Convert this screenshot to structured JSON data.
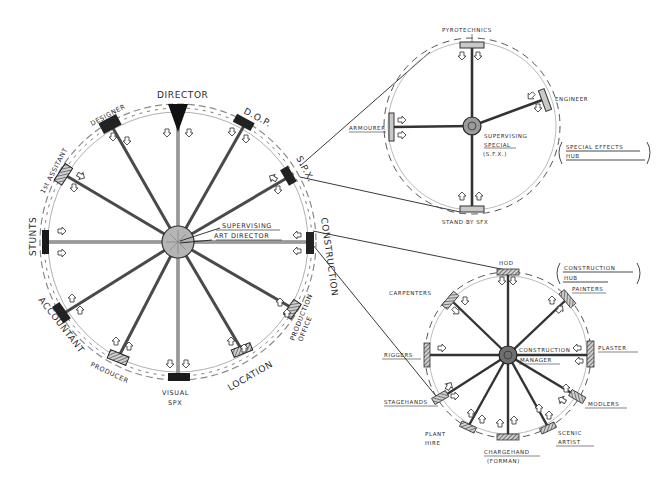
{
  "main_wheel": {
    "hub_label_line1": "SUPERVISING",
    "hub_label_line2": "ART DIRECTOR",
    "departments": {
      "director": "DIRECTOR",
      "dop": "D.O.P.",
      "spx": "S.P.X.",
      "construction": "CONSTRUCTION",
      "production_office_1": "PRODUCTION",
      "production_office_2": "OFFICE",
      "location": "LOCATION",
      "visual_spx_1": "VISUAL",
      "visual_spx_2": "SPX",
      "producer": "PRODUCER",
      "accountant": "ACCOUNTANT",
      "stunts": "STUNTS",
      "first_assistant": "1st ASSITANT",
      "designer": "DESIGNER"
    }
  },
  "special_effects_hub": {
    "title_line1": "SPECIAL EFFECTS",
    "title_line2": "HUB",
    "hub_label_line1": "SUPERVISING",
    "hub_label_line2": "SPECIAL",
    "hub_label_line3": "(S.F.X.)",
    "departments": {
      "pyrotechnics": "PYROTECHNICS",
      "engineer": "ENGINEER",
      "armourer": "ARMOURER",
      "standby_sfx": "STAND BY SFX"
    }
  },
  "construction_hub": {
    "title_line1": "CONSTRUCTION",
    "title_line2": "HUB",
    "hub_label_line1": "CONSTRUCTION",
    "hub_label_line2": "MANAGER",
    "departments": {
      "hod": "HOD",
      "painters": "PAINTERS",
      "plaster": "PLASTER",
      "modelers": "MODLERS",
      "scenic_artist_1": "SCENIC",
      "scenic_artist_2": "ARTIST",
      "chargehand_1": "CHARGEHAND",
      "chargehand_2": "(FORMAN)",
      "plant_hire_1": "PLANT",
      "plant_hire_2": "HIRE",
      "stagehands": "STAGEHANDS",
      "riggers": "RIGGERS",
      "carpenters": "CARPENTERS"
    }
  },
  "colors": {
    "ink": "#2a2a2a",
    "pencil": "#6e6e6e",
    "rim": "#9a9a9a",
    "hub_fill": "#b5b5b5",
    "block_fill": "#1e1e1e",
    "background": "#ffffff"
  }
}
